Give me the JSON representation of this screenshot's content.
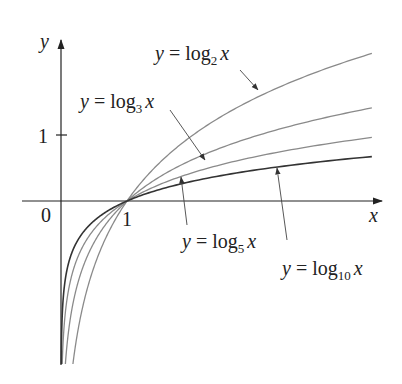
{
  "chart_data": {
    "type": "line",
    "title": "",
    "xlabel": "x",
    "ylabel": "y",
    "origin_label": "0",
    "x_ticks": [
      {
        "value": 1,
        "label": "1"
      }
    ],
    "y_ticks": [
      {
        "value": 1,
        "label": "1"
      }
    ],
    "xlim": [
      0,
      4.8
    ],
    "ylim": [
      -2.45,
      2.4
    ],
    "grid": false,
    "legend": "annotations with arrows",
    "series": [
      {
        "name": "y = log_2 x",
        "base": 2,
        "label_prefix": "y = log",
        "label_sub": "2",
        "label_suffix": "x",
        "color": "#8a8a8a",
        "x": [
          0.18,
          0.25,
          0.5,
          1,
          2,
          3,
          4,
          4.71
        ],
        "values": [
          -2.47,
          -2,
          -1,
          0,
          1,
          1.585,
          2,
          2.236
        ]
      },
      {
        "name": "y = log_3 x",
        "base": 3,
        "label_prefix": "y = log",
        "label_sub": "3",
        "label_suffix": "x",
        "color": "#8a8a8a",
        "x": [
          0.07,
          0.25,
          0.5,
          1,
          2,
          3,
          4,
          4.71
        ],
        "values": [
          -2.42,
          -1.262,
          -0.631,
          0,
          0.631,
          1,
          1.262,
          1.411
        ]
      },
      {
        "name": "y = log_5 x",
        "base": 5,
        "label_prefix": "y = log",
        "label_sub": "5",
        "label_suffix": "x",
        "color": "#8a8a8a",
        "x": [
          0.02,
          0.25,
          0.5,
          1,
          2,
          3,
          4,
          4.71
        ],
        "values": [
          -2.43,
          -0.861,
          -0.431,
          0,
          0.431,
          0.683,
          0.861,
          0.963
        ]
      },
      {
        "name": "y = log_10 x",
        "base": 10,
        "label_prefix": "y = log",
        "label_sub": "10",
        "label_suffix": "x",
        "color": "#333333",
        "x": [
          0.004,
          0.25,
          0.5,
          1,
          2,
          3,
          4,
          4.71
        ],
        "values": [
          -2.4,
          -0.602,
          -0.301,
          0,
          0.301,
          0.477,
          0.602,
          0.673
        ]
      }
    ]
  }
}
